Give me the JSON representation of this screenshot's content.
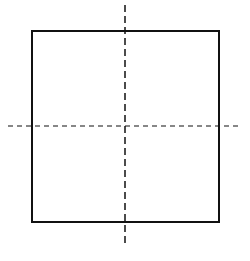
{
  "diagram": {
    "title": "",
    "colors": {
      "stroke": "#111111",
      "background": "#ffffff"
    },
    "square": {
      "x": 32,
      "y": 31,
      "width": 187,
      "height": 191
    },
    "center_lines": {
      "vertical": {
        "x": 125,
        "y1": 5,
        "y2": 246
      },
      "horizontal": {
        "y": 126,
        "x1": 8,
        "x2": 242
      }
    }
  }
}
